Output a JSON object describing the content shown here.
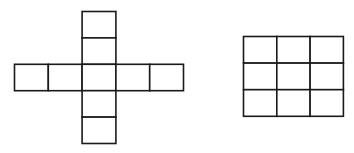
{
  "diagram": {
    "figures": [
      {
        "name": "cross-net",
        "shape": "cross",
        "cell_count": 9,
        "cells": [
          [
            2,
            0
          ],
          [
            2,
            1
          ],
          [
            0,
            2
          ],
          [
            1,
            2
          ],
          [
            2,
            2
          ],
          [
            3,
            2
          ],
          [
            4,
            2
          ],
          [
            2,
            3
          ],
          [
            2,
            4
          ]
        ]
      },
      {
        "name": "square-grid",
        "shape": "grid",
        "rows": 3,
        "cols": 3,
        "cell_count": 9
      }
    ],
    "colors": {
      "stroke": "#1a1a1a",
      "fill": "#ffffff"
    }
  }
}
